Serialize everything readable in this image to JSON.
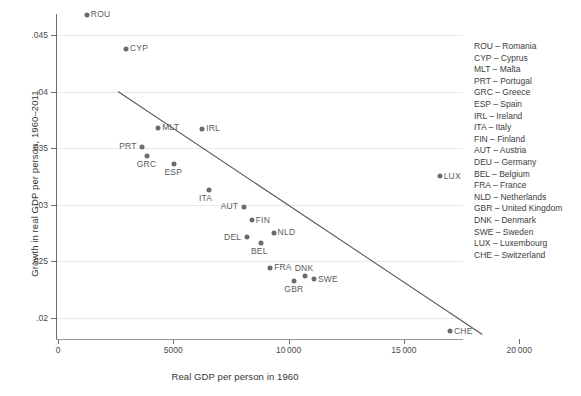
{
  "chart_data": {
    "type": "scatter",
    "title": "",
    "xlabel": "Real GDP per person in 1960",
    "ylabel": "Growth in real GDP per person, 1960–2011",
    "xlim": [
      0,
      20000
    ],
    "ylim": [
      0.0175,
      0.0475
    ],
    "grid": true,
    "legend_position": "right",
    "xticks": [
      0,
      5000,
      10000,
      15000,
      20000
    ],
    "xtick_labels": [
      "0",
      "5000",
      "10 000",
      "15 000",
      "20 000"
    ],
    "yticks": [
      0.02,
      0.025,
      0.03,
      0.035,
      0.04,
      0.045
    ],
    "ytick_labels": [
      ".02",
      ".025",
      ".03",
      ".035",
      ".04",
      ".045"
    ],
    "points": [
      {
        "code": "ROU",
        "x": 1250,
        "y": 0.0468,
        "label_side": "right"
      },
      {
        "code": "CYP",
        "x": 2950,
        "y": 0.0438,
        "label_side": "right"
      },
      {
        "code": "MLT",
        "x": 4350,
        "y": 0.0368,
        "label_side": "right"
      },
      {
        "code": "PRT",
        "x": 3650,
        "y": 0.0351,
        "label_side": "left"
      },
      {
        "code": "GRC",
        "x": 3850,
        "y": 0.0343,
        "label_side": "below"
      },
      {
        "code": "ESP",
        "x": 5050,
        "y": 0.0336,
        "label_side": "below"
      },
      {
        "code": "IRL",
        "x": 6250,
        "y": 0.0367,
        "label_side": "right"
      },
      {
        "code": "ITA",
        "x": 6550,
        "y": 0.0313,
        "label_side": "below"
      },
      {
        "code": "AUT",
        "x": 8050,
        "y": 0.0298,
        "label_side": "left"
      },
      {
        "code": "FIN",
        "x": 8400,
        "y": 0.0286,
        "label_side": "right"
      },
      {
        "code": "DEL",
        "x": 8200,
        "y": 0.0271,
        "label_side": "left"
      },
      {
        "code": "BEL",
        "x": 8800,
        "y": 0.0266,
        "label_side": "below"
      },
      {
        "code": "NLD",
        "x": 9350,
        "y": 0.0275,
        "label_side": "right"
      },
      {
        "code": "FRA",
        "x": 9200,
        "y": 0.0244,
        "label_side": "right"
      },
      {
        "code": "GBR",
        "x": 10250,
        "y": 0.0232,
        "label_side": "below"
      },
      {
        "code": "DNK",
        "x": 10700,
        "y": 0.0237,
        "label_side": "above"
      },
      {
        "code": "SWE",
        "x": 11100,
        "y": 0.0234,
        "label_side": "right"
      },
      {
        "code": "LUX",
        "x": 16550,
        "y": 0.0325,
        "label_side": "right"
      },
      {
        "code": "CHE",
        "x": 17000,
        "y": 0.0188,
        "label_side": "right"
      }
    ],
    "fit_line": {
      "x0": 2600,
      "y0": 0.04,
      "x1": 18400,
      "y1": 0.0185
    },
    "marker_color": "#6b6b6b",
    "line_color": "#5a5a5a",
    "grid_color": "#e9e9e9"
  },
  "legend": {
    "entries": [
      "ROU – Romania",
      "CYP – Cyprus",
      "MLT – Malta",
      "PRT – Portugal",
      "GRC – Greece",
      "ESP – Spain",
      "IRL – Ireland",
      "ITA – Italy",
      "FIN – Finland",
      "AUT – Austria",
      "DEU – Germany",
      "BEL – Belgium",
      "FRA – France",
      "NLD – Netherlands",
      "GBR – United Kingdom",
      "DNK – Denmark",
      "SWE – Sweden",
      "LUX – Luxembourg",
      "CHE – Switzerland"
    ]
  }
}
